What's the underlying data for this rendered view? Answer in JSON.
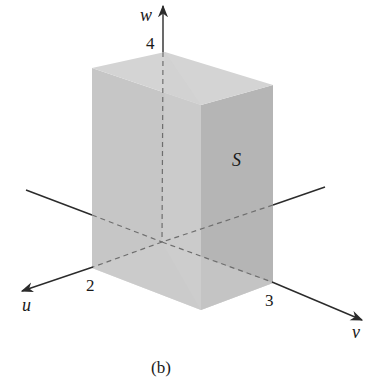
{
  "figure": {
    "caption": "(b)",
    "region_label": "S",
    "axes": {
      "u": {
        "label": "u",
        "tick_label": "2"
      },
      "v": {
        "label": "v",
        "tick_label": "3"
      },
      "w": {
        "label": "w",
        "tick_label": "4"
      }
    },
    "colors": {
      "background": "#ffffff",
      "face_top": "#d6d6d6",
      "face_left": "#c4c4c4",
      "face_right": "#b2b2b2",
      "face_inner_light": "#d9d9d9",
      "axis": "#2b2b2b",
      "hidden_axis": "#707070"
    }
  }
}
